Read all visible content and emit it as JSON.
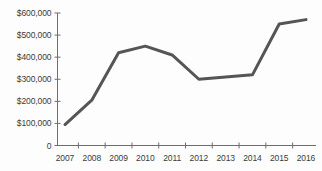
{
  "chart_data": {
    "type": "line",
    "title": "",
    "subtitle": "",
    "xlabel": "",
    "ylabel": "",
    "categories": [
      "2007",
      "2008",
      "2009",
      "2010",
      "2011",
      "2012",
      "2013",
      "2014",
      "2015",
      "2016"
    ],
    "values": [
      95000,
      205000,
      420000,
      450000,
      410000,
      300000,
      310000,
      320000,
      550000,
      570000
    ],
    "series": [
      {
        "name": "",
        "values": [
          95000,
          205000,
          420000,
          450000,
          410000,
          300000,
          310000,
          320000,
          550000,
          570000
        ]
      }
    ],
    "ylim": [
      0,
      600000
    ],
    "y_ticks": [
      0,
      100000,
      200000,
      300000,
      400000,
      500000,
      600000
    ],
    "y_tick_labels": [
      "0",
      "$100,000",
      "$200,000",
      "$300,000",
      "$400,000",
      "$500,000",
      "$600,000"
    ],
    "x_tick_labels": [
      "2007",
      "2008",
      "2009",
      "2010",
      "2011",
      "2012",
      "2013",
      "2014",
      "2015",
      "2016"
    ],
    "grid": false,
    "legend": "none",
    "line_color": "#555555",
    "axis_color": "#6e6e6e",
    "text_color": "#3b3b3b",
    "background_color": "#fdfdfd",
    "line_width": 3
  }
}
